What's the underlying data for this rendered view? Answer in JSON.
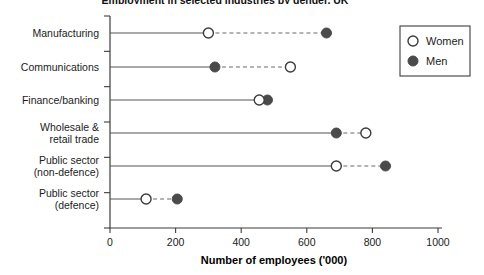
{
  "chart_data": {
    "type": "scatter",
    "subtype": "dumbbell",
    "title": "Employment in selected industries by gender, UK",
    "xlabel": "Number of employees ('000)",
    "ylabel": "",
    "xlim": [
      0,
      1000
    ],
    "xticks": [
      0,
      200,
      400,
      600,
      800,
      1000
    ],
    "xtick_labels": [
      "0",
      "200",
      "400",
      "600",
      "800",
      "1000"
    ],
    "grid": false,
    "legend_position": "top-right",
    "categories": [
      "Manufacturing",
      "Communications",
      "Finance/banking",
      "Wholesale & retail trade",
      "Public sector (non-defence)",
      "Public sector (defence)"
    ],
    "category_lines": [
      [
        "Manufacturing"
      ],
      [
        "Communications"
      ],
      [
        "Finance/banking"
      ],
      [
        "Wholesale &",
        "retail trade"
      ],
      [
        "Public sector",
        "(non-defence)"
      ],
      [
        "Public sector",
        "(defence)"
      ]
    ],
    "series": [
      {
        "name": "Women",
        "marker": "open-circle",
        "color": "#ffffff",
        "edge_color": "#3c3c3c",
        "values": [
          300,
          550,
          455,
          780,
          690,
          110
        ]
      },
      {
        "name": "Men",
        "marker": "filled-circle",
        "color": "#4a4a4a",
        "edge_color": "#4a4a4a",
        "values": [
          660,
          320,
          480,
          690,
          840,
          205
        ]
      }
    ],
    "legend": [
      {
        "label": "Women",
        "marker": "open-circle"
      },
      {
        "label": "Men",
        "marker": "filled-circle"
      }
    ]
  },
  "colors": {
    "axis": "#3c3c3c",
    "connector_solid": "#555555",
    "connector_dashed": "#6a6a6a",
    "men_fill": "#4a4a4a",
    "women_fill": "#ffffff",
    "marker_edge": "#3c3c3c",
    "legend_border": "#3c3c3c",
    "text": "#1b1b1b"
  }
}
